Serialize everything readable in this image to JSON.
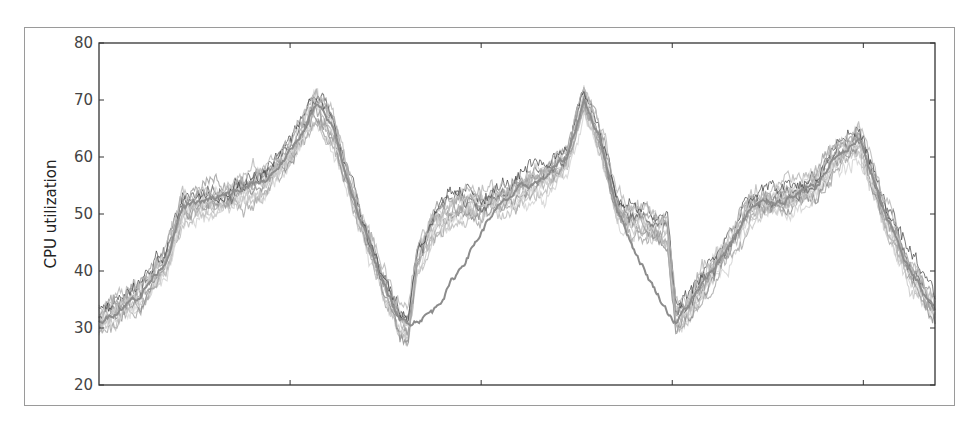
{
  "chart_data": {
    "type": "line",
    "title": "",
    "xlabel": "",
    "ylabel": "CPU utilization",
    "ylim": [
      20,
      80
    ],
    "yticks": [
      20,
      30,
      40,
      50,
      60,
      70,
      80
    ],
    "ytick_labels": [
      "20",
      "30",
      "40",
      "50",
      "60",
      "70",
      "80"
    ],
    "xticks_count": 4,
    "xtick_labels": [],
    "grid": false,
    "legend": null,
    "colors": {
      "band_light": "#c8c8c8",
      "band_mid": "#9a9a9a",
      "band_dark": "#2a2a2a",
      "outlier": "#8c8c8c",
      "axis": "#333333"
    },
    "note": "Many overlapping noisy gray series forming a band; one outlier series diverges after each trough.",
    "x": [
      0,
      0.02,
      0.05,
      0.08,
      0.1,
      0.12,
      0.15,
      0.2,
      0.23,
      0.26,
      0.28,
      0.31,
      0.34,
      0.36,
      0.37,
      0.38,
      0.4,
      0.43,
      0.47,
      0.5,
      0.53,
      0.56,
      0.58,
      0.6,
      0.62,
      0.64,
      0.66,
      0.68,
      0.69,
      0.7,
      0.72,
      0.76,
      0.78,
      0.8,
      0.83,
      0.86,
      0.88,
      0.91,
      0.94,
      0.97,
      1.0
    ],
    "series": [
      {
        "name": "main band (median)",
        "values": [
          31,
          33,
          36,
          42,
          51,
          52,
          53,
          56,
          61,
          69,
          65,
          50,
          38,
          31,
          30,
          42,
          48,
          51,
          52,
          54,
          56,
          60,
          70,
          63,
          51,
          49,
          48,
          47,
          32,
          33,
          37,
          46,
          51,
          52,
          53,
          55,
          60,
          63,
          50,
          40,
          33
        ]
      },
      {
        "name": "outlier series",
        "values": [
          31,
          33,
          36,
          42,
          51,
          52,
          53,
          56,
          61,
          69,
          65,
          50,
          38,
          31,
          31,
          31.5,
          33,
          40,
          50,
          54,
          56,
          60,
          70,
          63,
          51,
          44,
          38,
          33,
          31,
          33,
          37,
          46,
          51,
          52,
          53,
          55,
          60,
          63,
          50,
          40,
          33
        ]
      }
    ]
  }
}
